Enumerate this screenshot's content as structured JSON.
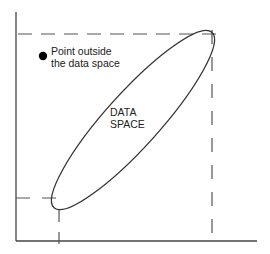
{
  "diagram": {
    "outside_point": {
      "label_line1": "Point outside",
      "label_line2": "the data space"
    },
    "data_space": {
      "label_line1": "DATA",
      "label_line2": "SPACE"
    }
  },
  "colors": {
    "line": "#333333",
    "dash": "#555555",
    "point": "#000000"
  }
}
